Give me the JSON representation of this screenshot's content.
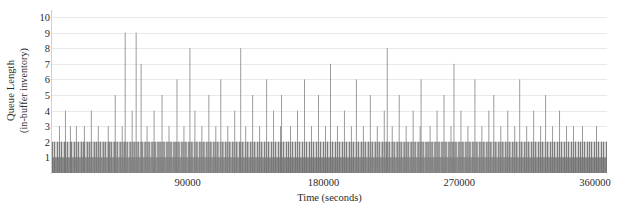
{
  "chart_data": {
    "type": "bar",
    "title": "",
    "subtitle": "",
    "xlabel": "Time (seconds)",
    "ylabel_line1": "Queue Length",
    "ylabel_line2": "(in-buffer inventory)",
    "ylabel": "Queue Length (in-buffer inventory)",
    "grid": "horizontal",
    "legend": "none",
    "xlim": [
      0,
      368000
    ],
    "ylim": [
      0,
      10
    ],
    "xticks": [
      90000,
      180000,
      270000,
      360000
    ],
    "xtick_labels": [
      "90000",
      "180000",
      "270000",
      "360000"
    ],
    "yticks": [
      1,
      2,
      3,
      4,
      5,
      6,
      7,
      8,
      9,
      10
    ],
    "ytick_labels": [
      "1",
      "2",
      "3",
      "4",
      "5",
      "6",
      "7",
      "8",
      "9",
      "10"
    ],
    "bar_color": "#8a8a8a",
    "bar_color_dense": "#787878",
    "gridline_color": "#e9e9e9",
    "axis_color": "#cfcfcf",
    "background": "#ffffff",
    "n_bars": 555,
    "series": [
      {
        "name": "Queue Length",
        "note": "Queue length sampled across the run; dominated by values of 1-2 with sparse spikes up to 9.",
        "values": [
          2,
          1,
          2,
          1,
          1,
          2,
          1,
          3,
          1,
          2,
          1,
          1,
          2,
          4,
          1,
          2,
          1,
          1,
          3,
          2,
          1,
          1,
          2,
          1,
          3,
          1,
          2,
          1,
          1,
          2,
          1,
          2,
          3,
          1,
          1,
          2,
          1,
          2,
          1,
          4,
          1,
          1,
          2,
          1,
          2,
          1,
          3,
          1,
          2,
          1,
          1,
          2,
          1,
          2,
          1,
          1,
          3,
          2,
          1,
          2,
          1,
          1,
          2,
          5,
          1,
          2,
          1,
          1,
          2,
          1,
          3,
          1,
          2,
          9,
          1,
          2,
          1,
          1,
          2,
          1,
          4,
          1,
          2,
          1,
          9,
          1,
          2,
          1,
          1,
          7,
          2,
          1,
          1,
          2,
          1,
          3,
          1,
          2,
          1,
          1,
          2,
          1,
          4,
          2,
          1,
          1,
          2,
          1,
          2,
          1,
          5,
          1,
          2,
          1,
          1,
          2,
          1,
          3,
          1,
          2,
          1,
          1,
          2,
          1,
          2,
          6,
          1,
          2,
          1,
          1,
          2,
          1,
          3,
          1,
          2,
          1,
          1,
          2,
          8,
          1,
          2,
          1,
          1,
          4,
          1,
          2,
          1,
          1,
          2,
          1,
          3,
          1,
          2,
          1,
          1,
          2,
          1,
          5,
          1,
          2,
          1,
          1,
          2,
          1,
          3,
          1,
          2,
          1,
          1,
          6,
          1,
          2,
          1,
          1,
          2,
          1,
          3,
          1,
          2,
          1,
          1,
          2,
          1,
          4,
          1,
          2,
          1,
          1,
          2,
          8,
          1,
          2,
          1,
          1,
          3,
          1,
          2,
          1,
          1,
          2,
          1,
          5,
          1,
          2,
          1,
          1,
          2,
          1,
          3,
          1,
          2,
          1,
          1,
          2,
          1,
          6,
          1,
          2,
          1,
          1,
          2,
          1,
          4,
          1,
          2,
          1,
          1,
          2,
          1,
          3,
          5,
          1,
          2,
          1,
          1,
          2,
          1,
          2,
          1,
          3,
          1,
          2,
          1,
          1,
          2,
          1,
          4,
          1,
          2,
          1,
          1,
          2,
          1,
          6,
          1,
          2,
          1,
          1,
          2,
          1,
          3,
          1,
          2,
          1,
          1,
          2,
          1,
          5,
          1,
          2,
          1,
          1,
          2,
          1,
          3,
          1,
          2,
          1,
          1,
          7,
          1,
          2,
          1,
          1,
          2,
          1,
          3,
          1,
          2,
          1,
          1,
          2,
          1,
          4,
          1,
          2,
          1,
          1,
          2,
          1,
          3,
          1,
          2,
          1,
          1,
          6,
          1,
          2,
          1,
          1,
          2,
          1,
          3,
          1,
          2,
          1,
          1,
          2,
          1,
          5,
          1,
          2,
          1,
          1,
          2,
          1,
          3,
          1,
          2,
          1,
          1,
          2,
          1,
          4,
          1,
          2,
          8,
          1,
          2,
          1,
          1,
          3,
          1,
          2,
          1,
          1,
          2,
          1,
          5,
          1,
          2,
          1,
          1,
          2,
          1,
          3,
          1,
          2,
          1,
          1,
          2,
          1,
          4,
          1,
          2,
          1,
          1,
          2,
          1,
          3,
          6,
          1,
          2,
          1,
          1,
          2,
          1,
          2,
          1,
          3,
          1,
          2,
          1,
          1,
          2,
          1,
          4,
          1,
          2,
          1,
          1,
          2,
          1,
          5,
          1,
          2,
          1,
          1,
          2,
          1,
          3,
          1,
          2,
          7,
          1,
          2,
          1,
          1,
          2,
          1,
          4,
          1,
          2,
          1,
          1,
          2,
          1,
          3,
          1,
          2,
          1,
          1,
          2,
          1,
          6,
          1,
          2,
          1,
          1,
          2,
          1,
          3,
          1,
          2,
          1,
          1,
          2,
          1,
          4,
          1,
          2,
          1,
          1,
          5,
          1,
          2,
          1,
          1,
          2,
          1,
          3,
          1,
          2,
          1,
          1,
          2,
          1,
          4,
          1,
          2,
          1,
          1,
          2,
          1,
          3,
          1,
          2,
          1,
          1,
          6,
          1,
          2,
          1,
          1,
          2,
          1,
          3,
          1,
          2,
          1,
          1,
          2,
          1,
          4,
          1,
          2,
          1,
          1,
          2,
          1,
          3,
          1,
          2,
          1,
          1,
          5,
          1,
          2,
          1,
          1,
          2,
          1,
          3,
          1,
          2,
          1,
          1,
          2,
          1,
          4,
          1,
          2,
          1,
          1,
          2,
          1,
          3,
          1,
          2,
          1,
          1,
          2,
          1,
          3,
          1,
          2,
          1,
          1,
          2,
          1,
          2,
          1,
          3,
          1,
          2,
          1,
          1,
          2,
          1,
          2,
          1,
          2,
          1,
          1,
          2,
          1,
          3,
          1,
          2,
          1,
          1,
          2,
          1,
          2,
          1,
          1,
          2
        ]
      }
    ]
  },
  "axes": {
    "ytick_labels": [
      "10",
      "9",
      "8",
      "7",
      "6",
      "5",
      "4",
      "3",
      "2",
      "1"
    ],
    "xtick_labels": [
      "90000",
      "180000",
      "270000",
      "360000"
    ]
  }
}
